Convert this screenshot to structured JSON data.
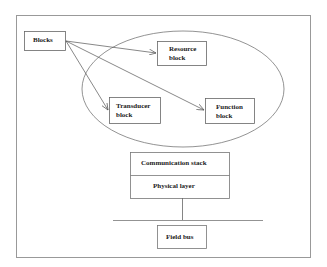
{
  "diagram": {
    "blocks_label": "Blocks",
    "resource_block": [
      "Resource",
      "block"
    ],
    "transducer_block": [
      "Transducer",
      "block"
    ],
    "function_block": [
      "Function",
      "block"
    ],
    "stack": {
      "top": "Communication stack",
      "bottom": "Physical layer"
    },
    "field_bus": "Field bus"
  },
  "colors": {
    "line": "#555555",
    "frame": "#888888"
  }
}
